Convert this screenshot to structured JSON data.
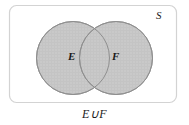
{
  "figure": {
    "type": "venn-diagram",
    "universe_label": "S",
    "caption": "E∪F",
    "sets": [
      {
        "id": "E",
        "label": "E"
      },
      {
        "id": "F",
        "label": "F"
      }
    ],
    "shaded_region": "union",
    "colors": {
      "fill": "#c9c9c9",
      "stroke": "#8a8a8a",
      "frame": "#d0d0d0",
      "text": "#1a1a1a",
      "background": "#ffffff"
    },
    "geometry": {
      "frame": {
        "x": 9,
        "y": 5,
        "width": 168,
        "height": 98,
        "radius": 7
      },
      "circle_e": {
        "cx": 73,
        "cy": 58,
        "r": 37
      },
      "circle_f": {
        "cx": 116,
        "cy": 58,
        "r": 37
      }
    }
  }
}
